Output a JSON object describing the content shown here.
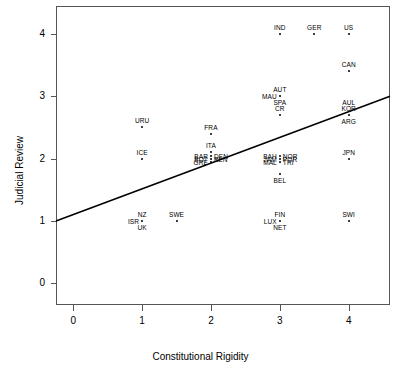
{
  "chart_data": {
    "type": "scatter",
    "title": "",
    "xlabel": "Constitutional Rigidity",
    "ylabel": "Judicial Review",
    "xlim": [
      -0.25,
      4.6
    ],
    "ylim": [
      -0.35,
      4.45
    ],
    "xticks": [
      "0",
      "1",
      "2",
      "3",
      "4"
    ],
    "xtick_values": [
      0,
      1,
      2,
      3,
      4
    ],
    "yticks": [
      "0",
      "1",
      "2",
      "3",
      "4"
    ],
    "ytick_values": [
      0,
      1,
      2,
      3,
      4
    ],
    "grid": false,
    "legend": null,
    "trendline": {
      "name": "regression-line",
      "x_start": -0.25,
      "y_start": 1.0,
      "x_end": 4.6,
      "y_end": 3.0,
      "color": "#000000"
    },
    "points": [
      {
        "label": "IND",
        "x": 3.0,
        "y": 4.0,
        "pos": "above"
      },
      {
        "label": "GER",
        "x": 3.5,
        "y": 4.0,
        "pos": "above"
      },
      {
        "label": "US",
        "x": 4.0,
        "y": 4.0,
        "pos": "above"
      },
      {
        "label": "CAN",
        "x": 4.0,
        "y": 3.4,
        "pos": "above"
      },
      {
        "label": "AUT",
        "x": 3.0,
        "y": 3.0,
        "pos": "above"
      },
      {
        "label": "MAU",
        "x": 3.0,
        "y": 3.0,
        "pos": "left"
      },
      {
        "label": "AUL",
        "x": 4.0,
        "y": 2.7,
        "pos": "above2"
      },
      {
        "label": "KOR",
        "x": 4.0,
        "y": 2.7,
        "pos": "above"
      },
      {
        "label": "ARG",
        "x": 4.0,
        "y": 2.7,
        "pos": "below"
      },
      {
        "label": "SPA",
        "x": 3.0,
        "y": 2.7,
        "pos": "above2"
      },
      {
        "label": "CR",
        "x": 3.0,
        "y": 2.7,
        "pos": "above"
      },
      {
        "label": "URU",
        "x": 1.0,
        "y": 2.5,
        "pos": "above"
      },
      {
        "label": "FRA",
        "x": 2.0,
        "y": 2.4,
        "pos": "above"
      },
      {
        "label": "ITA",
        "x": 2.0,
        "y": 2.1,
        "pos": "above"
      },
      {
        "label": "BAR",
        "x": 2.0,
        "y": 2.05,
        "pos": "left"
      },
      {
        "label": "DEN",
        "x": 2.0,
        "y": 2.05,
        "pos": "right"
      },
      {
        "label": "BOT",
        "x": 2.0,
        "y": 2.0,
        "pos": "left"
      },
      {
        "label": "BEN",
        "x": 2.0,
        "y": 2.0,
        "pos": "right"
      },
      {
        "label": "GRE",
        "x": 2.0,
        "y": 1.95,
        "pos": "left"
      },
      {
        "label": "ICE",
        "x": 1.0,
        "y": 2.0,
        "pos": "above"
      },
      {
        "label": "BAH",
        "x": 3.0,
        "y": 2.05,
        "pos": "left"
      },
      {
        "label": "NOR",
        "x": 3.0,
        "y": 2.05,
        "pos": "right"
      },
      {
        "label": "JAM",
        "x": 3.0,
        "y": 2.0,
        "pos": "left"
      },
      {
        "label": "POR",
        "x": 3.0,
        "y": 2.0,
        "pos": "right"
      },
      {
        "label": "MAL",
        "x": 3.0,
        "y": 1.95,
        "pos": "left"
      },
      {
        "label": "TRI",
        "x": 3.0,
        "y": 1.95,
        "pos": "right"
      },
      {
        "label": "JPN",
        "x": 4.0,
        "y": 2.0,
        "pos": "above"
      },
      {
        "label": "BEL",
        "x": 3.0,
        "y": 1.75,
        "pos": "below"
      },
      {
        "label": "NZ",
        "x": 1.0,
        "y": 1.0,
        "pos": "above"
      },
      {
        "label": "ISR",
        "x": 1.0,
        "y": 1.0,
        "pos": "left"
      },
      {
        "label": "UK",
        "x": 1.0,
        "y": 1.0,
        "pos": "below"
      },
      {
        "label": "SWE",
        "x": 1.5,
        "y": 1.0,
        "pos": "above"
      },
      {
        "label": "FIN",
        "x": 3.0,
        "y": 1.0,
        "pos": "above"
      },
      {
        "label": "LUX",
        "x": 3.0,
        "y": 1.0,
        "pos": "left"
      },
      {
        "label": "NET",
        "x": 3.0,
        "y": 1.0,
        "pos": "below"
      },
      {
        "label": "SWI",
        "x": 4.0,
        "y": 1.0,
        "pos": "above"
      }
    ]
  }
}
